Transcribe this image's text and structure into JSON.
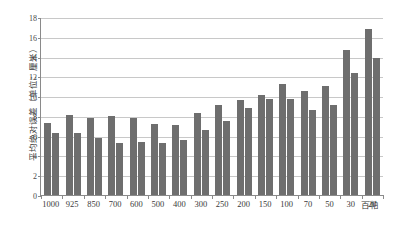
{
  "chart_data": {
    "type": "bar",
    "title": "",
    "xlabel": "百帕",
    "ylabel": "平均绝对误差（单位：厘米）",
    "ylim": [
      0,
      18
    ],
    "yticks": [
      0,
      2,
      4,
      6,
      8,
      10,
      12,
      14,
      16,
      18
    ],
    "grid": true,
    "legend": "none",
    "categories": [
      "1000",
      "925",
      "850",
      "700",
      "600",
      "500",
      "400",
      "300",
      "250",
      "200",
      "150",
      "100",
      "70",
      "50",
      "30",
      "20"
    ],
    "series": [
      {
        "name": "series-1",
        "color": "#6e6e6e",
        "values": [
          7.3,
          8.1,
          7.8,
          7.95,
          7.75,
          7.2,
          7.1,
          8.3,
          9.1,
          9.65,
          10.1,
          11.25,
          10.5,
          11.0,
          14.7,
          16.8
        ]
      },
      {
        "name": "series-2",
        "color": "#6e6e6e",
        "values": [
          6.3,
          6.3,
          5.8,
          5.3,
          5.35,
          5.3,
          5.6,
          6.6,
          7.5,
          8.8,
          9.75,
          9.7,
          8.55,
          9.15,
          12.3,
          13.9
        ]
      }
    ]
  }
}
